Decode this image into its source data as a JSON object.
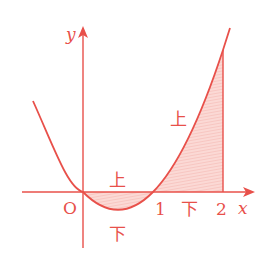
{
  "diagram": {
    "title": "",
    "function": "y = x(x - 1)",
    "axes": {
      "x_label": "x",
      "y_label": "y",
      "origin_label": "O",
      "x_ticks": [
        "1",
        "2"
      ]
    },
    "region_labels": {
      "upper_left": "上",
      "lower_left": "下",
      "upper_right": "上",
      "lower_right": "下"
    },
    "shaded_regions": [
      {
        "from": 0,
        "to": 1,
        "description": "between curve and x-axis below axis"
      },
      {
        "from": 1,
        "to": 2,
        "description": "between curve and x-axis above axis"
      }
    ],
    "colors": {
      "line": "#e8504a",
      "fill": "#f9d0cc"
    }
  }
}
